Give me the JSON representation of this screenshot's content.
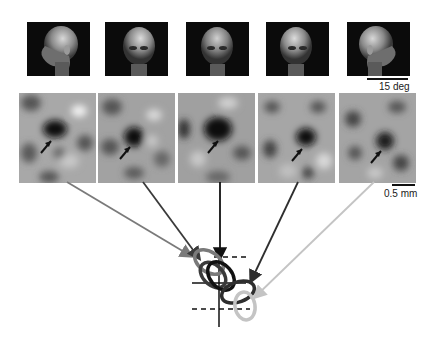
{
  "figure": {
    "faces": [
      {
        "id": "face-1",
        "view": "left profile"
      },
      {
        "id": "face-2",
        "view": "left three-quarter"
      },
      {
        "id": "face-3",
        "view": "frontal"
      },
      {
        "id": "face-4",
        "view": "right three-quarter"
      },
      {
        "id": "face-5",
        "view": "right profile"
      }
    ],
    "maps": [
      {
        "id": "map-1",
        "line_color": "#7a7a7a"
      },
      {
        "id": "map-2",
        "line_color": "#3a3a3a"
      },
      {
        "id": "map-3",
        "line_color": "#111111"
      },
      {
        "id": "map-4",
        "line_color": "#2e2e2e"
      },
      {
        "id": "map-5",
        "line_color": "#c4c4c4"
      }
    ],
    "scale_face": {
      "label": "15 deg"
    },
    "scale_map": {
      "label": "0.5 mm"
    }
  }
}
